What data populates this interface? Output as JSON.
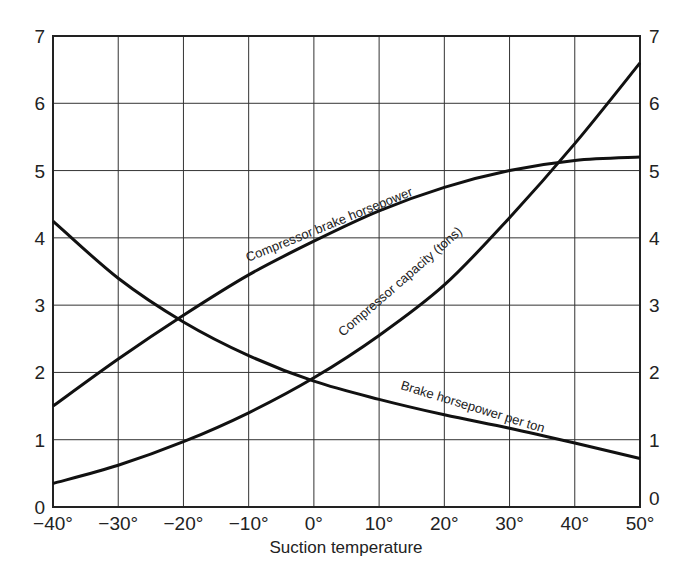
{
  "chart_data": {
    "type": "line",
    "title": "",
    "xlabel": "Suction temperature",
    "ylabel": "",
    "x": [
      -40,
      -30,
      -20,
      -10,
      0,
      10,
      20,
      30,
      40,
      50
    ],
    "x_tick_labels": [
      "−40°",
      "−30°",
      "−20°",
      "−10°",
      "0°",
      "10°",
      "20°",
      "30°",
      "40°",
      "50°"
    ],
    "y_tick_labels_left": [
      "0",
      "1",
      "2",
      "3",
      "4",
      "5",
      "6",
      "7"
    ],
    "y_tick_labels_right": [
      "0",
      "1",
      "2",
      "3",
      "4",
      "5",
      "6",
      "7"
    ],
    "xlim": [
      -40,
      50
    ],
    "ylim": [
      0,
      7
    ],
    "grid": true,
    "legend": "inline curve labels",
    "series": [
      {
        "name": "Compressor brake horsepower",
        "values": [
          1.5,
          2.2,
          2.85,
          3.45,
          3.95,
          4.4,
          4.75,
          5.0,
          5.15,
          5.2
        ]
      },
      {
        "name": "Compressor capacity (tons)",
        "values": [
          0.35,
          0.62,
          0.97,
          1.4,
          1.92,
          2.55,
          3.3,
          4.3,
          5.4,
          6.6
        ]
      },
      {
        "name": "Brake horsepower per ton",
        "values": [
          4.25,
          3.4,
          2.75,
          2.25,
          1.87,
          1.6,
          1.37,
          1.17,
          0.95,
          0.72
        ]
      }
    ]
  },
  "labels": {
    "xlabel": "Suction temperature",
    "bhp": "Compressor brake horsepower",
    "capacity": "Compressor capacity (tons)",
    "bhp_per_ton": "Brake horsepower per ton"
  }
}
